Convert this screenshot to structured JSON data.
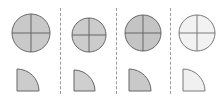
{
  "figure": {
    "title": "",
    "background_color": "#ffffff",
    "stroke_color": "#666666",
    "divider_color": "#9a9a9a",
    "panel_count": 4
  },
  "dividers": [
    {
      "name": "divider-1",
      "x": 60
    },
    {
      "name": "divider-2",
      "x": 116
    },
    {
      "name": "divider-3",
      "x": 170
    }
  ],
  "panels": [
    {
      "id": "panel-1",
      "label": "1",
      "x": 0,
      "width": 60,
      "circle": {
        "cx": 31,
        "cy": 33,
        "r": 19,
        "fill": "#c9c9c9",
        "stroke": "#666666",
        "stroke_width": 1,
        "crosshair": true
      },
      "sector": {
        "x": 17,
        "y": 69,
        "size": 22,
        "fill": "#cccccc",
        "stroke": "#666666",
        "stroke_width": 1,
        "arc_corner": "top-right"
      }
    },
    {
      "id": "panel-2",
      "label": "2",
      "x": 60,
      "width": 56,
      "circle": {
        "cx": 89,
        "cy": 35,
        "r": 17,
        "fill": "#cccccc",
        "stroke": "#666666",
        "stroke_width": 1,
        "crosshair": true
      },
      "sector": {
        "x": 74,
        "y": 70,
        "size": 21,
        "fill": "#cfcfcf",
        "stroke": "#666666",
        "stroke_width": 1,
        "arc_corner": "top-right"
      }
    },
    {
      "id": "panel-3",
      "label": "3",
      "x": 116,
      "width": 54,
      "circle": {
        "cx": 143,
        "cy": 33,
        "r": 18,
        "fill": "#c4c4c4",
        "stroke": "#666666",
        "stroke_width": 1,
        "crosshair": true
      },
      "sector": {
        "x": 129,
        "y": 69,
        "size": 22,
        "fill": "#c9c9c9",
        "stroke": "#666666",
        "stroke_width": 1,
        "arc_corner": "top-right"
      }
    },
    {
      "id": "panel-4",
      "label": "4",
      "x": 170,
      "width": 54,
      "circle": {
        "cx": 197,
        "cy": 33,
        "r": 18,
        "fill": "#f2f2f2",
        "stroke": "#7a7a7a",
        "stroke_width": 1,
        "crosshair": true
      },
      "sector": {
        "x": 183,
        "y": 69,
        "size": 22,
        "fill": "#f0f0f0",
        "stroke": "#7a7a7a",
        "stroke_width": 1,
        "arc_corner": "top-right"
      }
    }
  ]
}
